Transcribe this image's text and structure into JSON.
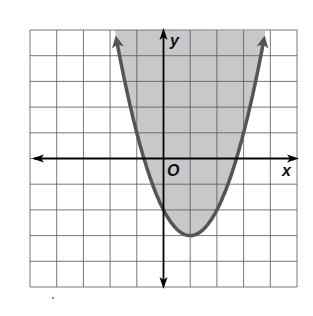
{
  "chart_data": {
    "type": "line",
    "title": "",
    "function": "y >= (x - 1)^2 - 3",
    "boundary": "solid",
    "shading": "inside (above) parabola",
    "vertex": [
      1,
      -3
    ],
    "y_intercept": -2,
    "x_intercepts": [
      -0.73,
      2.73
    ],
    "xlabel": "x",
    "ylabel": "y",
    "origin_label": "O",
    "xlim": [
      -5,
      5
    ],
    "ylim": [
      -5,
      5
    ],
    "grid": true,
    "grid_step": 1,
    "colors": {
      "curve": "#555555",
      "shade": "#c8c8c8",
      "grid": "#555555",
      "axes": "#000000"
    }
  },
  "labels": {
    "x": "x",
    "y": "y",
    "origin": "O"
  }
}
